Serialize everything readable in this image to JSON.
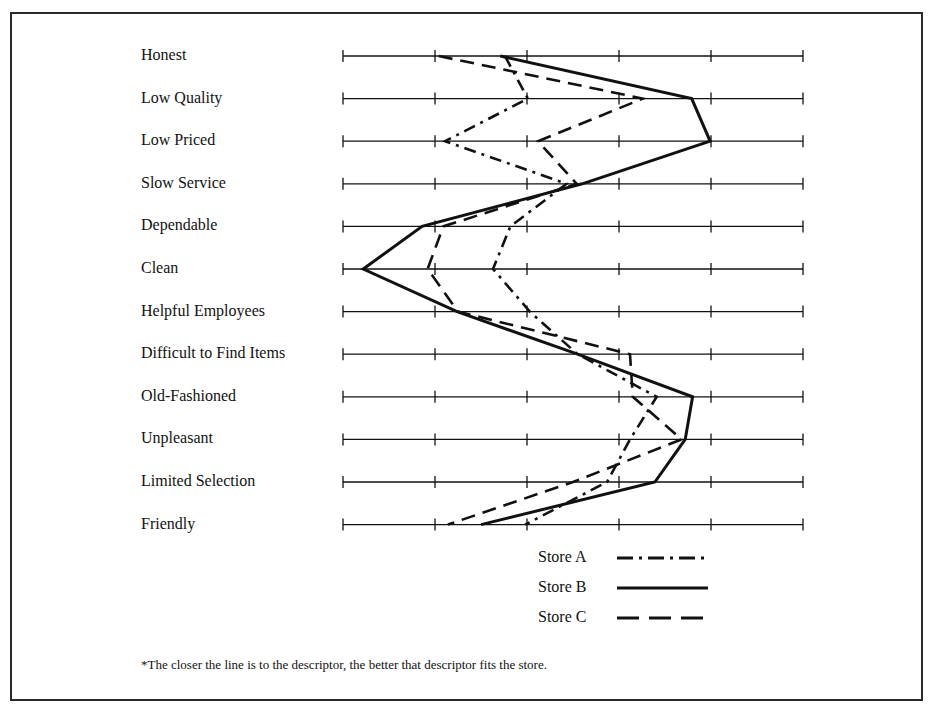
{
  "chart_data": {
    "type": "line",
    "orientation": "horizontal-profile",
    "title": "",
    "xlabel": "",
    "ylabel": "",
    "scale": {
      "min": 1,
      "max": 6,
      "ticks": [
        1,
        2,
        3,
        4,
        5,
        6
      ],
      "tick_labels_shown": false
    },
    "categories": [
      "Honest",
      "Low Quality",
      "Low Priced",
      "Slow Service",
      "Dependable",
      "Clean",
      "Helpful Employees",
      "Difficult to Find Items",
      "Old-Fashioned",
      "Unpleasant",
      "Limited Selection",
      "Friendly"
    ],
    "series": [
      {
        "name": "Store A",
        "style": "dash-dot",
        "values": [
          2.76,
          3.01,
          2.11,
          3.43,
          2.82,
          2.63,
          3.03,
          3.55,
          4.41,
          4.12,
          3.87,
          2.98
        ]
      },
      {
        "name": "Store B",
        "style": "solid",
        "values": [
          2.71,
          4.79,
          4.99,
          3.6,
          1.86,
          1.22,
          2.24,
          3.55,
          4.8,
          4.72,
          4.39,
          2.5
        ]
      },
      {
        "name": "Store C",
        "style": "dashed",
        "values": [
          2.04,
          4.26,
          3.12,
          3.54,
          2.09,
          1.92,
          2.25,
          4.12,
          4.15,
          4.68,
          3.5,
          2.14
        ]
      }
    ],
    "legend": {
      "position": "bottom-center",
      "entries": [
        "Store A",
        "Store B",
        "Store C"
      ]
    },
    "grid": false,
    "annotation": "*The closer the line is to the descriptor, the better that descriptor fits the store."
  },
  "legend": [
    {
      "label": "Store A",
      "style": "dash-dot"
    },
    {
      "label": "Store B",
      "style": "solid"
    },
    {
      "label": "Store C",
      "style": "dashed"
    }
  ],
  "footnote": "*The closer the line is to the descriptor, the better that descriptor fits the store.",
  "colors": {
    "ink": "#111111",
    "frame": "#2a2a2a",
    "background": "#ffffff"
  }
}
